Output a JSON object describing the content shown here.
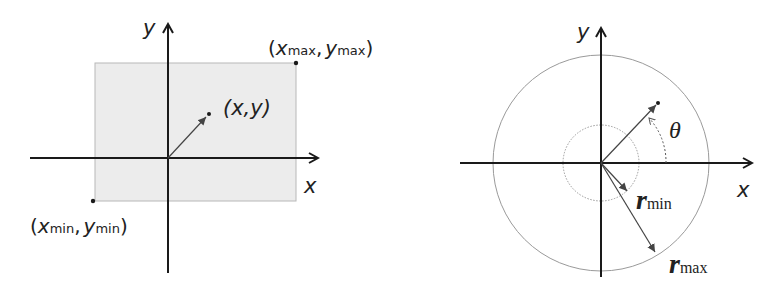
{
  "colors": {
    "axis": "#1a1a1a",
    "rect_fill": "#ececec",
    "rect_stroke": "#b8b8b8",
    "circle_stroke": "#9a9a9a",
    "vector": "#444444"
  },
  "cartesian": {
    "y_axis_label": "y",
    "x_axis_label": "x",
    "max_corner": {
      "open": "(",
      "x": "x",
      "x_sub": "max",
      "sep": ",",
      "y": "y",
      "y_sub": "max",
      "close": ")"
    },
    "min_corner": {
      "open": "(",
      "x": "x",
      "x_sub": "min",
      "sep": ",",
      "y": "y",
      "y_sub": "min",
      "close": ")"
    },
    "point_label": "(x,y)"
  },
  "polar": {
    "y_axis_label": "y",
    "x_axis_label": "x",
    "angle_label": "θ",
    "r_min": {
      "r": "r",
      "sub": "min"
    },
    "r_max": {
      "r": "r",
      "sub": "max"
    }
  }
}
